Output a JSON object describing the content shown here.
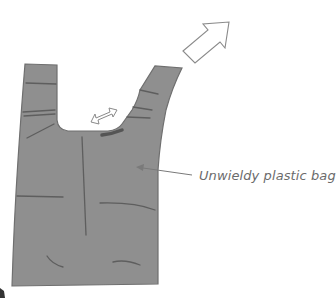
{
  "diagram": {
    "title": "",
    "labels": {
      "bag": "Unwieldy plastic bag"
    },
    "elements": [
      {
        "id": "bag",
        "type": "shape",
        "description": "grey plastic carrier bag with two handles"
      },
      {
        "id": "stretch-arrow",
        "type": "double-arrow",
        "description": "small double-headed arrow between handles"
      },
      {
        "id": "lift-arrow",
        "type": "outline-arrow",
        "description": "large outline arrow pointing up-right from right handle"
      },
      {
        "id": "label-leader",
        "type": "line",
        "description": "leader line from label to bag"
      }
    ],
    "colors": {
      "bag_fill": "#8f8f8f",
      "bag_stroke": "#6f6f6f",
      "crease": "#5e5e5e",
      "arrow_stroke": "#8a8a8a",
      "label_text": "#6b6b6b",
      "background": "#ffffff"
    }
  }
}
